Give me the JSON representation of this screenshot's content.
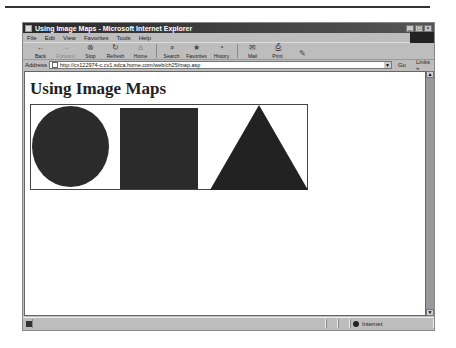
{
  "window": {
    "title": "Using Image Maps - Microsoft Internet Explorer",
    "controls": [
      "minimize",
      "maximize",
      "close"
    ]
  },
  "menubar": {
    "items": [
      {
        "label": "File"
      },
      {
        "label": "Edit"
      },
      {
        "label": "View"
      },
      {
        "label": "Favorites"
      },
      {
        "label": "Tools"
      },
      {
        "label": "Help"
      }
    ]
  },
  "toolbar": {
    "buttons": [
      {
        "label": "Back",
        "icon": "←",
        "enabled": true
      },
      {
        "label": "Forward",
        "icon": "→",
        "enabled": false
      },
      {
        "label": "Stop",
        "icon": "⊗",
        "enabled": true
      },
      {
        "label": "Refresh",
        "icon": "↻",
        "enabled": true
      },
      {
        "label": "Home",
        "icon": "⌂",
        "enabled": true
      },
      {
        "label": "Search",
        "icon": "⌕",
        "enabled": true
      },
      {
        "label": "Favorites",
        "icon": "★",
        "enabled": true
      },
      {
        "label": "History",
        "icon": "◔",
        "enabled": true
      },
      {
        "label": "Mail",
        "icon": "✉",
        "enabled": true
      },
      {
        "label": "Print",
        "icon": "⎙",
        "enabled": true
      },
      {
        "label": "",
        "icon": "✎",
        "enabled": true
      }
    ]
  },
  "addressbar": {
    "label": "Address",
    "url": "http://cx122974-c.cv1.sdca.home.com/web/ch25/map.asp",
    "go_label": "Go",
    "links_label": "Links »"
  },
  "page": {
    "heading": "Using Image Maps",
    "image_map": {
      "shapes": [
        "circle",
        "square",
        "triangle"
      ],
      "fill_color": "#2b2b2b"
    }
  },
  "statusbar": {
    "status_text": "",
    "zone_label": "Internet"
  }
}
